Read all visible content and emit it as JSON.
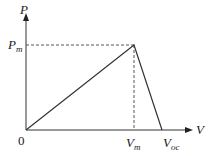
{
  "diagram": {
    "axes": {
      "y_label": "P",
      "x_label": "V",
      "origin_label": "0"
    },
    "points": {
      "peak_power": {
        "main": "P",
        "sub": "m"
      },
      "peak_voltage": {
        "main": "V",
        "sub": "m"
      },
      "open_circuit_voltage": {
        "main": "V",
        "sub": "oc"
      }
    },
    "colors": {
      "axis": "#333333",
      "curve": "#333333",
      "dashed": "#555555"
    }
  }
}
